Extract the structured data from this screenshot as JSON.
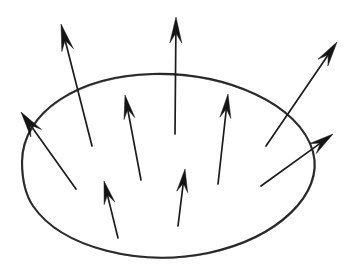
{
  "figure": {
    "background_color": "#ffffff",
    "ink_color": "#1c1c1c",
    "boundary_color": "#262626",
    "canvas": {
      "width": 356,
      "height": 266
    }
  },
  "boundary": {
    "name": "closed-surface-ellipse",
    "shape": "ellipse",
    "center_x": 168,
    "center_y": 166,
    "radius_x": 146,
    "radius_y": 92,
    "stroke_width": 2.1,
    "style": "hand-drawn",
    "path": "M 22 162 C 22 112, 78 76, 152 74 C 226 72, 300 104, 313 152 C 324 194, 278 238, 208 253 C 140 267, 62 248, 33 206 C 25 194, 22 178, 22 162 Z"
  },
  "vectors": [
    {
      "id": "vector-left-outward",
      "label": "left outward flux vector",
      "crosses_boundary": true,
      "tail_x": 76,
      "tail_y": 189,
      "tip_x": 21,
      "tip_y": 112,
      "head_length": 26,
      "head_width": 13
    },
    {
      "id": "vector-upper-left-outward",
      "label": "upper-left outward flux vector",
      "crosses_boundary": true,
      "tail_x": 92,
      "tail_y": 146,
      "tip_x": 61,
      "tip_y": 24,
      "head_length": 27,
      "head_width": 12
    },
    {
      "id": "vector-top-center-outward",
      "label": "top-center outward flux vector",
      "crosses_boundary": true,
      "tail_x": 175,
      "tail_y": 134,
      "tip_x": 176,
      "tip_y": 17,
      "head_length": 26,
      "head_width": 12
    },
    {
      "id": "vector-upper-right-outward",
      "label": "upper-right outward flux vector",
      "crosses_boundary": true,
      "tail_x": 266,
      "tail_y": 146,
      "tip_x": 337,
      "tip_y": 42,
      "head_length": 25,
      "head_width": 12
    },
    {
      "id": "vector-right-outward",
      "label": "right outward flux vector",
      "crosses_boundary": true,
      "tail_x": 261,
      "tail_y": 186,
      "tip_x": 333,
      "tip_y": 134,
      "head_length": 25,
      "head_width": 12
    },
    {
      "id": "vector-interior-left",
      "label": "interior left vector",
      "crosses_boundary": false,
      "tail_x": 141,
      "tail_y": 180,
      "tip_x": 125,
      "tip_y": 95,
      "head_length": 24,
      "head_width": 11
    },
    {
      "id": "vector-interior-right",
      "label": "interior right vector",
      "crosses_boundary": false,
      "tail_x": 218,
      "tail_y": 184,
      "tip_x": 228,
      "tip_y": 94,
      "head_length": 24,
      "head_width": 11
    },
    {
      "id": "vector-interior-lower-left",
      "label": "interior lower-left vector",
      "crosses_boundary": false,
      "tail_x": 118,
      "tail_y": 238,
      "tip_x": 104,
      "tip_y": 181,
      "head_length": 23,
      "head_width": 11
    },
    {
      "id": "vector-interior-lower-center",
      "label": "interior lower-center vector",
      "crosses_boundary": false,
      "tail_x": 178,
      "tail_y": 226,
      "tip_x": 185,
      "tip_y": 169,
      "head_length": 23,
      "head_width": 11
    }
  ]
}
